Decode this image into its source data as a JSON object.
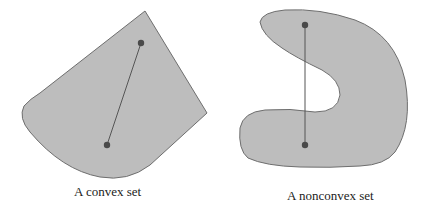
{
  "figure": {
    "left_panel": {
      "caption": "A convex set",
      "shape_fill": "#bdbdbd",
      "shape_stroke": "#6e6e6e",
      "point_a": {
        "x": 141,
        "y": 43
      },
      "point_b": {
        "x": 107,
        "y": 145
      }
    },
    "right_panel": {
      "caption": "A nonconvex set",
      "shape_fill": "#bdbdbd",
      "shape_stroke": "#6e6e6e",
      "point_a": {
        "x": 305,
        "y": 25
      },
      "point_b": {
        "x": 305,
        "y": 145
      }
    },
    "point_color": "#4a4a4a",
    "segment_color": "#555555"
  }
}
